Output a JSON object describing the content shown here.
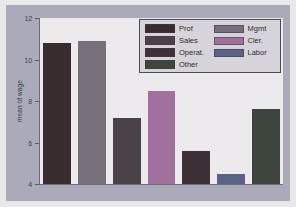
{
  "chart_data": {
    "type": "bar",
    "title": "",
    "xlabel": "",
    "ylabel": "mean of wage",
    "ylim": [
      4,
      12
    ],
    "yticks": [
      4,
      6,
      8,
      10,
      12
    ],
    "ytick_labels": [
      "4",
      "6",
      "8",
      "10",
      "12"
    ],
    "grid": false,
    "xtick_labels": [],
    "legend_position": "upper right",
    "legend_columns": 2,
    "categories": [
      "Prof",
      "Mgmt",
      "Sales",
      "Cler.",
      "Operat.",
      "Labor",
      "Other"
    ],
    "values": [
      10.8,
      10.9,
      7.2,
      8.5,
      5.6,
      4.5,
      7.6
    ],
    "bars": [
      {
        "category": "Prof",
        "value": 10.8,
        "color": "#382c2c"
      },
      {
        "category": "Mgmt",
        "value": 10.9,
        "color": "#77707a"
      },
      {
        "category": "Sales",
        "value": 7.2,
        "color": "#4b4148"
      },
      {
        "category": "Cler.",
        "value": 8.5,
        "color": "#a1709c"
      },
      {
        "category": "Operat.",
        "value": 5.6,
        "color": "#3d3036"
      },
      {
        "category": "Labor",
        "value": 4.5,
        "color": "#5c6285"
      },
      {
        "category": "Other",
        "value": 7.6,
        "color": "#3d453d"
      }
    ]
  },
  "legend": {
    "columns": [
      {
        "entries": [
          {
            "label": "Prof",
            "color": "#382c2c"
          },
          {
            "label": "Sales",
            "color": "#4b4148"
          },
          {
            "label": "Operat.",
            "color": "#3d3036"
          },
          {
            "label": "Other",
            "color": "#3d453d"
          }
        ]
      },
      {
        "entries": [
          {
            "label": "Mgmt",
            "color": "#77707a"
          },
          {
            "label": "Cler.",
            "color": "#a1709c"
          },
          {
            "label": "Labor",
            "color": "#5c6285"
          }
        ]
      }
    ]
  },
  "colors": {
    "figure_background": "#aaaab8",
    "page_margin": "#e9e9ec",
    "plot_background": "#eceaec",
    "axis": "#6d6d78",
    "legend_background": "#d6d4d8",
    "legend_border": "#4d4d57",
    "text": "#2c2c34"
  }
}
